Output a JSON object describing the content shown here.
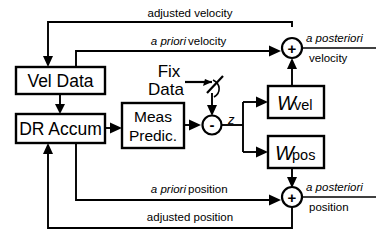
{
  "diagram": {
    "type": "block-diagram",
    "colors": {
      "stroke": "#000000",
      "fill": "#ffffff",
      "background": "#ffffff"
    },
    "blocks": [
      {
        "id": "vel-data",
        "label": "Vel Data",
        "x": 16,
        "y": 67,
        "w": 89,
        "h": 27
      },
      {
        "id": "dr-accum",
        "label": "DR Accum",
        "x": 16,
        "y": 114,
        "w": 89,
        "h": 29
      },
      {
        "id": "meas-predic",
        "label_line1": "Meas",
        "label_line2": "Predic.",
        "x": 122,
        "y": 103,
        "w": 62,
        "h": 45
      },
      {
        "id": "w-vel",
        "label": "W",
        "sublabel": "vel",
        "x": 268,
        "y": 86,
        "w": 56,
        "h": 32
      },
      {
        "id": "w-pos",
        "label": "W",
        "sublabel": "pos",
        "x": 268,
        "y": 136,
        "w": 56,
        "h": 32
      }
    ],
    "junctions": [
      {
        "id": "sum-z",
        "sign": "-",
        "cx": 212,
        "cy": 125,
        "r": 9.5
      },
      {
        "id": "sum-velocity",
        "sign": "+",
        "cx": 292,
        "cy": 48,
        "r": 10
      },
      {
        "id": "sum-position",
        "sign": "+",
        "cx": 292,
        "cy": 197,
        "r": 10
      }
    ],
    "standalone_labels": [
      {
        "id": "fix-data",
        "line1": "Fix",
        "line2": "Data",
        "x": 152,
        "y": 72
      },
      {
        "id": "z-signal",
        "text": "z",
        "x": 228,
        "y": 123
      }
    ],
    "wire_labels": [
      {
        "id": "adjusted-velocity",
        "text": "adjusted velocity",
        "italic_prefix": "",
        "x": 190,
        "y": 17
      },
      {
        "id": "a-priori-velocity",
        "text": "velocity",
        "italic_prefix": "a priori",
        "x": 190,
        "y": 45
      },
      {
        "id": "a-priori-position",
        "text": "position",
        "italic_prefix": "a priori",
        "x": 190,
        "y": 193
      },
      {
        "id": "adjusted-position",
        "text": "adjusted position",
        "italic_prefix": "",
        "x": 190,
        "y": 220
      }
    ],
    "outputs": [
      {
        "id": "a-posteriori-velocity",
        "italic_text": "a posteriori",
        "sub_text": "velocity",
        "x": 310,
        "y": 41
      },
      {
        "id": "a-posteriori-position",
        "italic_text": "a posteriori",
        "sub_text": "position",
        "x": 310,
        "y": 190
      }
    ]
  }
}
